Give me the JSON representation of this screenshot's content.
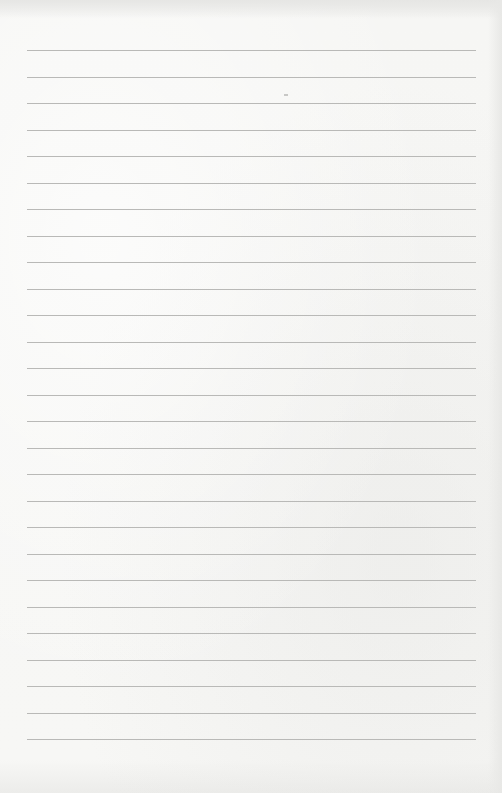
{
  "paper": {
    "type": "lined-paper",
    "background_color": "#f4f4f2",
    "line_color": "#b9b9b7",
    "line_count": 27,
    "line_left_px": 27,
    "line_right_px": 476,
    "first_line_y_px": 50,
    "line_spacing_px": 26.5
  }
}
